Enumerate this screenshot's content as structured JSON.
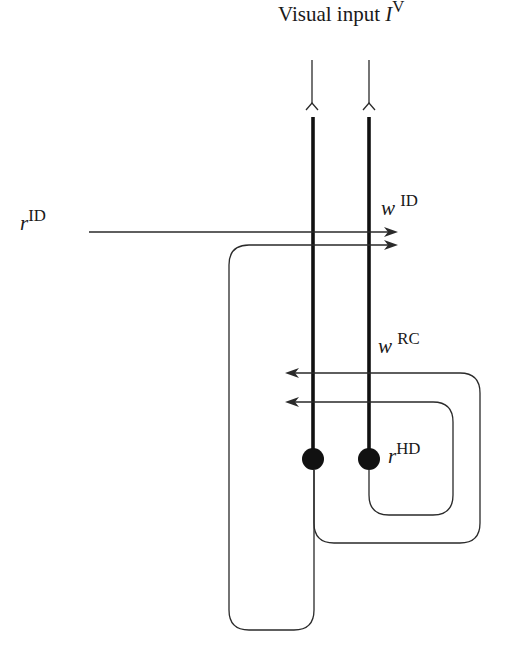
{
  "diagram": {
    "title": {
      "text": "Visual input ",
      "symbol": "I",
      "superscript": "V"
    },
    "labels": {
      "r_id": {
        "symbol": "r",
        "superscript": "ID"
      },
      "w_id": {
        "symbol": "w",
        "superscript": "ID"
      },
      "w_rc": {
        "symbol": "w",
        "superscript": "RC"
      },
      "r_hd": {
        "symbol": "r",
        "superscript": "HD"
      }
    },
    "nodes": [
      {
        "id": "left-neuron",
        "x": 313,
        "y": 459,
        "r": 11
      },
      {
        "id": "right-neuron",
        "x": 369,
        "y": 459,
        "r": 11
      }
    ],
    "colors": {
      "line": "#2a2a2a",
      "axon": "#111111",
      "background": "#ffffff"
    }
  }
}
